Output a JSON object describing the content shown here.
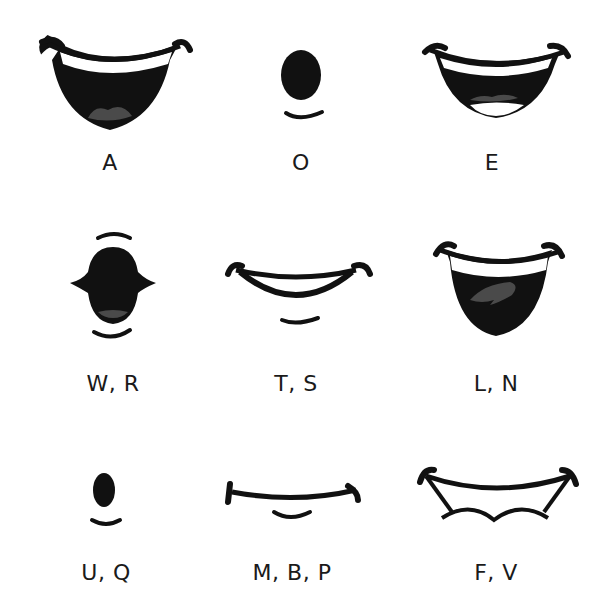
{
  "colors": {
    "ink": "#111111",
    "tongue": "#4a4a4a",
    "teeth": "#ffffff",
    "background": "#ffffff"
  },
  "shapes": [
    {
      "id": "a",
      "label": "A",
      "description": "wide open smile, upper teeth, tongue"
    },
    {
      "id": "o",
      "label": "O",
      "description": "small oval opening with lower lip arc"
    },
    {
      "id": "e",
      "label": "E",
      "description": "wide smile, upper and lower teeth, tongue"
    },
    {
      "id": "wr",
      "label": "W, R",
      "description": "puckered rounded opening, lip arcs above and below"
    },
    {
      "id": "ts",
      "label": "T, S",
      "description": "closed teeth smile with lower lip arc"
    },
    {
      "id": "ln",
      "label": "L, N",
      "description": "open mouth, upper teeth, raised tongue"
    },
    {
      "id": "uq",
      "label": "U, Q",
      "description": "small narrow oval with lower lip arc"
    },
    {
      "id": "mbp",
      "label": "M, B, P",
      "description": "closed lips line with lower lip arc"
    },
    {
      "id": "fv",
      "label": "F, V",
      "description": "upper teeth biting lower lip"
    }
  ]
}
